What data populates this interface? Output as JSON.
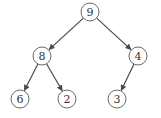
{
  "diagram": {
    "type": "binary-tree",
    "node_radius": 9,
    "colors": {
      "node_stroke": "#6a6a6a",
      "edge": "#4a4a4a",
      "label": "#333333",
      "background": "#ffffff"
    },
    "nodes": [
      {
        "id": "n9",
        "label": "9",
        "x": 90,
        "y": 12
      },
      {
        "id": "n8",
        "label": "8",
        "x": 42,
        "y": 56
      },
      {
        "id": "n4",
        "label": "4",
        "x": 138,
        "y": 56
      },
      {
        "id": "n6",
        "label": "6",
        "x": 20,
        "y": 99
      },
      {
        "id": "n2",
        "label": "2",
        "x": 67,
        "y": 99
      },
      {
        "id": "n3",
        "label": "3",
        "x": 117,
        "y": 99
      }
    ],
    "edges": [
      {
        "from": "n9",
        "to": "n8"
      },
      {
        "from": "n9",
        "to": "n4"
      },
      {
        "from": "n8",
        "to": "n6"
      },
      {
        "from": "n8",
        "to": "n2"
      },
      {
        "from": "n4",
        "to": "n3"
      }
    ]
  }
}
